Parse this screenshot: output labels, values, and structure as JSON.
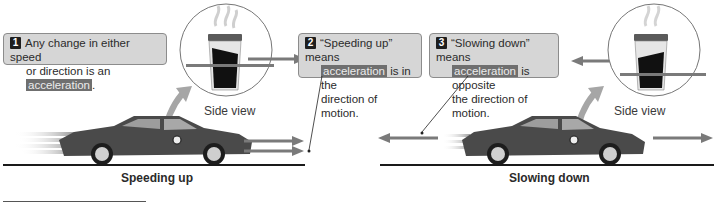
{
  "callouts": [
    {
      "number": "1",
      "line1": "Any change in either speed",
      "line2_pre": "or direction is an ",
      "highlight": "acceleration",
      "line2_post": "."
    },
    {
      "number": "2",
      "line1": "“Speeding up” means",
      "highlight": "acceleration",
      "line2_post": " is in the",
      "line3": "direction of motion."
    },
    {
      "number": "3",
      "line1": "“Slowing down” means",
      "highlight": "acceleration",
      "line2_post": " is opposite",
      "line3": "the direction of motion."
    }
  ],
  "panels": {
    "left": {
      "caption": "Speeding up",
      "inset_label": "Side view",
      "arrows": [
        "velocity-right",
        "acceleration-right"
      ]
    },
    "right": {
      "caption": "Slowing down",
      "inset_label": "Side view",
      "arrows": [
        "acceleration-left",
        "velocity-right"
      ]
    }
  },
  "colors": {
    "callout_bg": "#d6d6d6",
    "highlight_bg": "#6f6f6f",
    "arrow": "#7a7a7a",
    "car_body": "#4a4a4a",
    "liquid": "#111111"
  }
}
